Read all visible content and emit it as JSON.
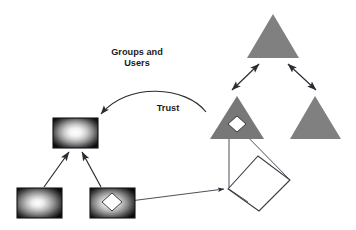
{
  "canvas": {
    "width": 356,
    "height": 230,
    "background": "#ffffff"
  },
  "labels": {
    "groups_line1": "Groups and",
    "groups_line2": "Users",
    "trust": "Trust"
  },
  "colors": {
    "triangle_fill": "#808080",
    "triangle_fill_dark": "#787878",
    "line": "#2b2b33",
    "text": "#1b1b24",
    "rect_border": "#15151b",
    "gradient_center": "#ffffff",
    "gradient_edge": "#0d0d0d",
    "diamond_fill": "#ffffff"
  },
  "nodes": {
    "rectangles": [
      {
        "id": "rect-top",
        "name": "gradient-rect-parent",
        "x": 53,
        "y": 118,
        "width": 45,
        "height": 30,
        "has_diamond": false
      },
      {
        "id": "rect-bottom-left",
        "name": "gradient-rect-child-left",
        "x": 17,
        "y": 188,
        "width": 45,
        "height": 30,
        "has_diamond": false
      },
      {
        "id": "rect-bottom-right",
        "name": "gradient-rect-child-right",
        "x": 90,
        "y": 188,
        "width": 45,
        "height": 30,
        "has_diamond": true
      }
    ],
    "triangles": [
      {
        "id": "tri-top",
        "name": "triangle-root",
        "apex_x": 273,
        "apex_y": 14,
        "left_x": 247,
        "right_x": 299,
        "base_y": 58,
        "has_diamond": false
      },
      {
        "id": "tri-mid-left",
        "name": "triangle-child-left",
        "apex_x": 237,
        "apex_y": 96,
        "left_x": 210,
        "right_x": 264,
        "base_y": 139,
        "has_diamond": true
      },
      {
        "id": "tri-mid-right",
        "name": "triangle-child-right",
        "apex_x": 315,
        "apex_y": 96,
        "left_x": 290,
        "right_x": 341,
        "base_y": 139,
        "has_diamond": false
      }
    ],
    "big_diamond": {
      "id": "diamond-outline",
      "name": "diamond-outline-shape",
      "points": "228,189 258,156 290,180 259,211"
    }
  },
  "edges": [
    {
      "id": "e1",
      "name": "edge-child-left-to-parent",
      "type": "arrow-single"
    },
    {
      "id": "e2",
      "name": "edge-child-right-to-parent",
      "type": "arrow-single"
    },
    {
      "id": "e3",
      "name": "edge-trust-arc",
      "type": "arrow-curved"
    },
    {
      "id": "e4",
      "name": "edge-root-to-left-triangle",
      "type": "arrow-double"
    },
    {
      "id": "e5",
      "name": "edge-root-to-right-triangle",
      "type": "arrow-double"
    },
    {
      "id": "e6",
      "name": "edge-triangle-to-diamond-vertical",
      "type": "line"
    },
    {
      "id": "e7",
      "name": "edge-triangle-to-diamond-diagonal",
      "type": "line"
    },
    {
      "id": "e8",
      "name": "edge-rect-to-diamond",
      "type": "arrow-single"
    }
  ]
}
